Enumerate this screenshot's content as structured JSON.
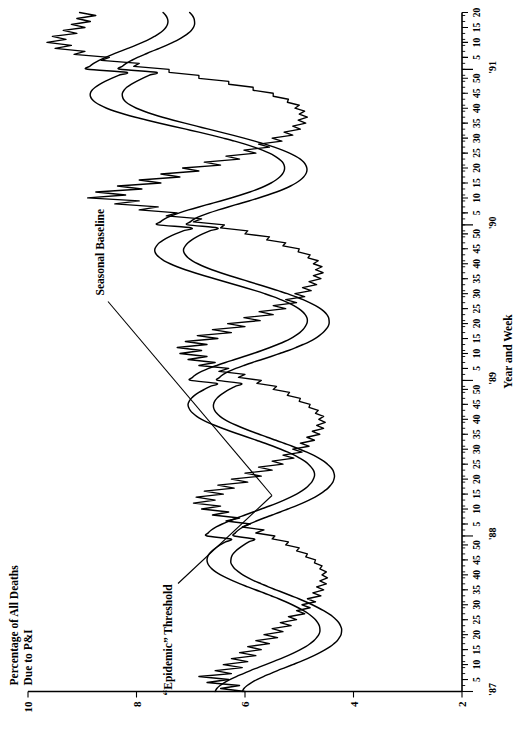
{
  "figure": {
    "orientation": "rotated-90-ccw",
    "background_color": "#ffffff",
    "ink_color": "#000000"
  },
  "axes": {
    "y_title_line1": "Percentage of All Deaths",
    "y_title_line2": "Due to P&I",
    "x_title": "Year and Week",
    "y_ticks": [
      "2",
      "4",
      "6",
      "8",
      "10"
    ],
    "y_tick_values": [
      2,
      4,
      6,
      8,
      10
    ],
    "y_min": 2,
    "y_max": 10,
    "week_ticks": [
      "5",
      "10",
      "15",
      "20",
      "25",
      "30",
      "35",
      "40",
      "45",
      "50"
    ],
    "years": [
      "'87",
      "'88",
      "'89",
      "'90",
      "'91"
    ]
  },
  "annotations": [
    {
      "id": "epidemic-threshold",
      "text": "“Epidemic” Threshold"
    },
    {
      "id": "seasonal-baseline",
      "text": "Seasonal Baseline"
    }
  ],
  "chart_data": {
    "type": "line",
    "title": "",
    "xlabel": "Year and Week",
    "ylabel": "Percentage of All Deaths Due to P&I",
    "ylim": [
      2,
      10
    ],
    "grid": false,
    "legend": "none (inline annotations with leader lines)",
    "x_tick_labels": [
      "5",
      "10",
      "15",
      "20",
      "25",
      "30",
      "35",
      "40",
      "45",
      "50"
    ],
    "year_boundaries": [
      "'87",
      "'88",
      "'89",
      "'90",
      "'91"
    ],
    "x_description": "Weekly observations, week 1 of 1987 through approximately week 20 of 1991",
    "series": [
      {
        "name": "Observed percentage of deaths due to P&I",
        "style": "jagged weekly line",
        "values": [
          6.0,
          6.45,
          6.1,
          6.7,
          6.3,
          6.85,
          6.25,
          6.55,
          6.05,
          6.4,
          5.95,
          6.25,
          5.8,
          6.1,
          5.7,
          5.95,
          5.55,
          5.8,
          5.4,
          5.65,
          5.3,
          5.5,
          5.15,
          5.35,
          5.05,
          5.2,
          4.9,
          5.05,
          4.8,
          4.95,
          4.7,
          4.85,
          4.6,
          4.75,
          4.55,
          4.68,
          4.5,
          4.62,
          4.48,
          4.58,
          4.5,
          4.62,
          4.58,
          4.72,
          4.7,
          4.88,
          4.85,
          5.05,
          5.0,
          5.25,
          5.2,
          5.5,
          5.45,
          5.8,
          5.65,
          6.05,
          5.9,
          6.35,
          6.1,
          6.6,
          6.3,
          6.8,
          6.45,
          6.95,
          6.55,
          6.9,
          6.4,
          6.75,
          6.2,
          6.5,
          5.95,
          6.25,
          5.7,
          6.0,
          5.5,
          5.75,
          5.3,
          5.5,
          5.1,
          5.3,
          4.95,
          5.12,
          4.82,
          4.98,
          4.72,
          4.86,
          4.62,
          4.76,
          4.55,
          4.68,
          4.52,
          4.64,
          4.55,
          4.7,
          4.65,
          4.82,
          4.8,
          5.0,
          4.98,
          5.22,
          5.18,
          5.48,
          5.42,
          5.78,
          5.7,
          6.12,
          6.0,
          6.48,
          6.3,
          6.85,
          6.55,
          7.05,
          6.7,
          7.2,
          6.8,
          7.25,
          6.7,
          7.1,
          6.5,
          6.88,
          6.25,
          6.6,
          6.0,
          6.32,
          5.72,
          6.02,
          5.48,
          5.74,
          5.25,
          5.48,
          5.05,
          5.25,
          4.9,
          5.08,
          4.78,
          4.94,
          4.68,
          4.82,
          4.6,
          4.74,
          4.56,
          4.7,
          4.58,
          4.74,
          4.65,
          4.84,
          4.8,
          5.02,
          5.0,
          5.3,
          5.25,
          5.6,
          5.55,
          6.0,
          5.95,
          6.45,
          6.38,
          6.95,
          6.8,
          7.45,
          7.25,
          7.95,
          7.6,
          8.4,
          7.95,
          8.9,
          8.2,
          8.75,
          7.9,
          8.35,
          7.55,
          7.95,
          7.2,
          7.55,
          6.85,
          7.15,
          6.45,
          6.75,
          6.1,
          6.35,
          5.8,
          6.02,
          5.55,
          5.75,
          5.32,
          5.5,
          5.12,
          5.28,
          4.98,
          5.12,
          4.88,
          5.02,
          4.85,
          5.0,
          4.9,
          5.08,
          5.0,
          5.22,
          5.2,
          5.48,
          5.48,
          5.85,
          5.85,
          6.3,
          6.3,
          6.85,
          6.85,
          7.4,
          7.4,
          8.05,
          7.95,
          8.65,
          8.5,
          9.15,
          8.95,
          9.5,
          9.2,
          9.65,
          9.3,
          9.55,
          9.1,
          9.35,
          8.95,
          9.2,
          8.85,
          9.1,
          8.75,
          9.05
        ]
      },
      {
        "name": "“Epidemic” Threshold",
        "style": "smooth upper curve",
        "values": [
          6.55,
          6.52,
          6.46,
          6.38,
          6.28,
          6.16,
          6.03,
          5.9,
          5.76,
          5.62,
          5.48,
          5.34,
          5.21,
          5.09,
          4.98,
          4.88,
          4.8,
          4.73,
          4.68,
          4.64,
          4.62,
          4.62,
          4.63,
          4.66,
          4.7,
          4.76,
          4.83,
          4.92,
          5.02,
          5.13,
          5.25,
          5.38,
          5.52,
          5.66,
          5.81,
          5.95,
          6.09,
          6.22,
          6.34,
          6.45,
          6.54,
          6.61,
          6.66,
          6.69,
          6.7,
          6.69,
          6.66,
          6.61,
          6.54,
          6.46,
          6.36,
          6.26,
          6.7,
          6.68,
          6.62,
          6.53,
          6.42,
          6.29,
          6.15,
          6.0,
          5.85,
          5.7,
          5.55,
          5.41,
          5.28,
          5.16,
          5.05,
          4.96,
          4.88,
          4.82,
          4.77,
          4.74,
          4.72,
          4.72,
          4.74,
          4.78,
          4.83,
          4.9,
          4.99,
          5.09,
          5.21,
          5.34,
          5.48,
          5.63,
          5.79,
          5.95,
          6.11,
          6.27,
          6.42,
          6.56,
          6.69,
          6.8,
          6.89,
          6.96,
          7.01,
          7.04,
          7.05,
          7.03,
          6.99,
          6.93,
          6.85,
          6.75,
          6.64,
          6.52,
          7.0,
          6.97,
          6.9,
          6.8,
          6.67,
          6.52,
          6.36,
          6.19,
          6.02,
          5.85,
          5.69,
          5.54,
          5.4,
          5.27,
          5.16,
          5.07,
          4.99,
          4.93,
          4.89,
          4.86,
          4.85,
          4.86,
          4.89,
          4.94,
          5.01,
          5.1,
          5.21,
          5.34,
          5.48,
          5.64,
          5.81,
          5.99,
          6.18,
          6.37,
          6.56,
          6.75,
          6.93,
          7.1,
          7.25,
          7.38,
          7.49,
          7.57,
          7.63,
          7.66,
          7.66,
          7.63,
          7.58,
          7.5,
          7.4,
          7.28,
          7.14,
          6.99,
          7.6,
          7.56,
          7.48,
          7.36,
          7.21,
          7.04,
          6.85,
          6.65,
          6.45,
          6.26,
          6.08,
          5.91,
          5.76,
          5.63,
          5.52,
          5.43,
          5.36,
          5.31,
          5.28,
          5.27,
          5.28,
          5.31,
          5.37,
          5.45,
          5.55,
          5.68,
          5.83,
          6.0,
          6.19,
          6.4,
          6.62,
          6.85,
          7.09,
          7.33,
          7.57,
          7.8,
          8.02,
          8.22,
          8.4,
          8.55,
          8.67,
          8.76,
          8.82,
          8.85,
          8.85,
          8.82,
          8.76,
          8.68,
          8.58,
          8.46,
          8.33,
          8.19,
          8.9,
          8.86,
          8.79,
          8.69,
          8.57,
          8.44,
          8.3,
          8.16,
          8.02,
          7.89,
          7.77,
          7.67,
          7.58,
          7.51,
          7.46,
          7.43,
          7.42,
          7.43,
          7.46,
          7.51
        ]
      },
      {
        "name": "Seasonal Baseline",
        "style": "smooth lower curve",
        "values": [
          6.05,
          6.02,
          5.96,
          5.88,
          5.78,
          5.66,
          5.53,
          5.4,
          5.26,
          5.12,
          4.98,
          4.85,
          4.73,
          4.62,
          4.52,
          4.43,
          4.36,
          4.3,
          4.26,
          4.23,
          4.22,
          4.22,
          4.24,
          4.27,
          4.32,
          4.38,
          4.46,
          4.55,
          4.65,
          4.76,
          4.88,
          5.01,
          5.15,
          5.29,
          5.43,
          5.57,
          5.7,
          5.83,
          5.94,
          6.04,
          6.12,
          6.19,
          6.23,
          6.26,
          6.26,
          6.25,
          6.22,
          6.17,
          6.1,
          6.02,
          5.93,
          5.83,
          6.2,
          6.18,
          6.12,
          6.03,
          5.92,
          5.79,
          5.65,
          5.5,
          5.35,
          5.21,
          5.07,
          4.94,
          4.82,
          4.71,
          4.62,
          4.54,
          4.47,
          4.42,
          4.38,
          4.36,
          4.35,
          4.36,
          4.38,
          4.42,
          4.48,
          4.55,
          4.64,
          4.74,
          4.86,
          4.99,
          5.13,
          5.28,
          5.43,
          5.59,
          5.74,
          5.89,
          6.03,
          6.16,
          6.28,
          6.38,
          6.46,
          6.52,
          6.56,
          6.58,
          6.58,
          6.56,
          6.52,
          6.46,
          6.38,
          6.29,
          6.18,
          6.07,
          6.5,
          6.47,
          6.4,
          6.3,
          6.17,
          6.02,
          5.86,
          5.69,
          5.52,
          5.36,
          5.2,
          5.06,
          4.93,
          4.81,
          4.71,
          4.63,
          4.56,
          4.51,
          4.47,
          4.45,
          4.45,
          4.46,
          4.49,
          4.54,
          4.61,
          4.7,
          4.81,
          4.93,
          5.07,
          5.22,
          5.39,
          5.56,
          5.74,
          5.92,
          6.1,
          6.28,
          6.45,
          6.61,
          6.75,
          6.87,
          6.97,
          7.05,
          7.1,
          7.13,
          7.13,
          7.1,
          7.05,
          6.98,
          6.89,
          6.78,
          6.65,
          6.51,
          7.05,
          7.01,
          6.93,
          6.81,
          6.66,
          6.49,
          6.31,
          6.12,
          5.93,
          5.75,
          5.58,
          5.42,
          5.28,
          5.16,
          5.06,
          4.98,
          4.92,
          4.88,
          4.86,
          4.86,
          4.88,
          4.92,
          4.98,
          5.07,
          5.18,
          5.31,
          5.46,
          5.63,
          5.82,
          6.02,
          6.23,
          6.45,
          6.67,
          6.89,
          7.11,
          7.32,
          7.52,
          7.7,
          7.86,
          8.0,
          8.11,
          8.19,
          8.24,
          8.26,
          8.26,
          8.23,
          8.18,
          8.1,
          8.0,
          7.89,
          7.77,
          7.64,
          8.3,
          8.26,
          8.19,
          8.09,
          7.98,
          7.85,
          7.72,
          7.58,
          7.45,
          7.33,
          7.22,
          7.13,
          7.05,
          6.99,
          6.95,
          6.93,
          6.93,
          6.94,
          6.97,
          7.02
        ]
      }
    ]
  }
}
